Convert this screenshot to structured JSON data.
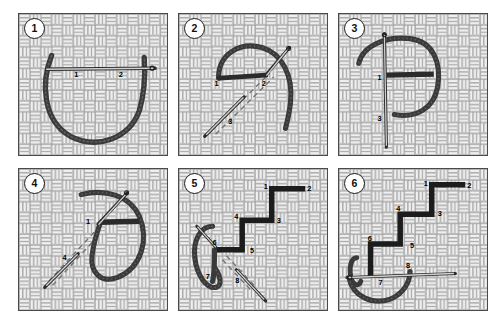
{
  "figure": {
    "panel_count": 6,
    "colors": {
      "thread": "#3a3a3a",
      "stitch": "#1c1c1c",
      "needle": "#d8d8d8",
      "needle_outline": "#2b2b2b",
      "weave_light": "#f2f2f2",
      "weave_line": "#8d8d8d",
      "panel_border": "#4a4a4a",
      "background": "#ffffff",
      "label": "#000000"
    }
  },
  "panels": [
    {
      "number": "1",
      "badge_label": "1",
      "description": "Needle passes horizontally through fabric with thread loop hanging below",
      "labels": [
        {
          "text": "1",
          "x": 56,
          "y": 64
        },
        {
          "text": "2",
          "x": 101,
          "y": 64
        }
      ],
      "needle": {
        "type": "horizontal",
        "eye_side": "right"
      },
      "thread_shape": "u-loop"
    },
    {
      "number": "2",
      "badge_label": "2",
      "description": "Needle enters on a diagonal through the loop; dashed guide line shows path",
      "labels": [
        {
          "text": "1",
          "x": 36,
          "y": 73
        },
        {
          "text": "2",
          "x": 84,
          "y": 73
        },
        {
          "text": "3",
          "x": 50,
          "y": 112
        }
      ],
      "needle": {
        "type": "diagonal",
        "eye_side": "top-right"
      },
      "thread_shape": "arc-loop",
      "guide": "dashed-diagonal"
    },
    {
      "number": "3",
      "badge_label": "3",
      "description": "Vertical needle through fabric with closed thread loop and bar stitch",
      "labels": [
        {
          "text": "1",
          "x": 39,
          "y": 67
        },
        {
          "text": "3",
          "x": 39,
          "y": 109
        }
      ],
      "needle": {
        "type": "vertical",
        "eye_side": "top"
      },
      "thread_shape": "ring-loop"
    },
    {
      "number": "4",
      "badge_label": "4",
      "description": "Diagonal needle re-entering the fabric to form the next step",
      "labels": [
        {
          "text": "1",
          "x": 68,
          "y": 56
        },
        {
          "text": "4",
          "x": 44,
          "y": 92
        }
      ],
      "needle": {
        "type": "diagonal",
        "eye_side": "top-right"
      },
      "thread_shape": "loop-bar",
      "guide": "dashed-diagonal"
    },
    {
      "number": "5",
      "badge_label": "5",
      "description": "Stepped staircase stitch line with numbered entry and exit points",
      "labels": [
        {
          "text": "1",
          "x": 86,
          "y": 20
        },
        {
          "text": "2",
          "x": 130,
          "y": 22
        },
        {
          "text": "3",
          "x": 99,
          "y": 55
        },
        {
          "text": "4",
          "x": 56,
          "y": 51
        },
        {
          "text": "5",
          "x": 72,
          "y": 85
        },
        {
          "text": "6",
          "x": 34,
          "y": 77
        },
        {
          "text": "7",
          "x": 27,
          "y": 112
        },
        {
          "text": "8",
          "x": 57,
          "y": 116
        }
      ],
      "needle": {
        "type": "diagonal",
        "eye_side": "bottom-right"
      },
      "thread_shape": "side-loop",
      "guide": "dashed-diagonal"
    },
    {
      "number": "6",
      "badge_label": "6",
      "description": "Completed staircase with horizontal needle drawing thread through at base",
      "labels": [
        {
          "text": "1",
          "x": 86,
          "y": 17
        },
        {
          "text": "2",
          "x": 130,
          "y": 19
        },
        {
          "text": "3",
          "x": 100,
          "y": 48
        },
        {
          "text": "4",
          "x": 58,
          "y": 43
        },
        {
          "text": "5",
          "x": 72,
          "y": 80
        },
        {
          "text": "6",
          "x": 29,
          "y": 73
        },
        {
          "text": "7",
          "x": 40,
          "y": 118
        },
        {
          "text": "8",
          "x": 68,
          "y": 100
        }
      ],
      "needle": {
        "type": "horizontal",
        "eye_side": "left"
      },
      "thread_shape": "bottom-loop"
    }
  ]
}
